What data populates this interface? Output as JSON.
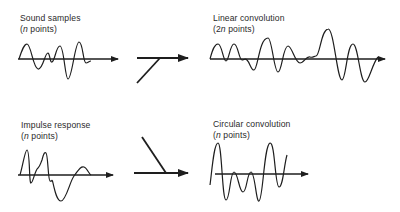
{
  "panels": {
    "sound_samples": {
      "title": "Sound samples",
      "paren_open": "(",
      "var": "n",
      "paren_rest": " points)"
    },
    "linear_convolution": {
      "title": "Linear convolution",
      "paren_open": "(2",
      "var": "n",
      "paren_rest": " points)"
    },
    "impulse_response": {
      "title": "Impulse response",
      "paren_open": "(",
      "var": "n",
      "paren_rest": " points)"
    },
    "circular_convolution": {
      "title": "Circular convolution",
      "paren_open": "(",
      "var": "n",
      "paren_rest": " points)"
    }
  },
  "connectors": {
    "top": "merge-arrow (input joins from below-left)",
    "bottom": "merge-arrow (input joins from above-left)"
  },
  "colors": {
    "ink": "#1e1e1e",
    "background": "#ffffff"
  }
}
